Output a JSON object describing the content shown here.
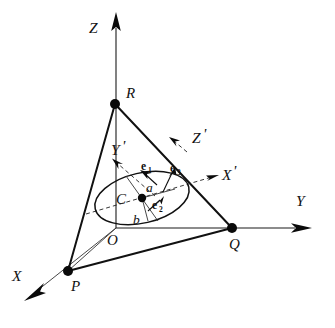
{
  "figure": {
    "background_color": "#ffffff",
    "ink_color": "#111111"
  },
  "global_axes": {
    "z": {
      "label": "Z",
      "arrow": "up"
    },
    "y": {
      "label": "Y",
      "arrow": "right"
    },
    "x": {
      "label": "X",
      "arrow": "down-left"
    }
  },
  "local_axes": {
    "x_prime": {
      "label": "X",
      "prime": "'",
      "arrow": "up-right",
      "style": "dashed"
    },
    "y_prime": {
      "label": "Y",
      "prime": "'",
      "arrow": "up-left",
      "style": "dashed"
    },
    "z_prime": {
      "label": "Z",
      "prime": "'",
      "arrow": "up-right",
      "style": "dashed"
    }
  },
  "points": {
    "origin": {
      "label": "O"
    },
    "p": {
      "label": "P"
    },
    "q": {
      "label": "Q"
    },
    "r": {
      "label": "R"
    },
    "c": {
      "label": "C"
    }
  },
  "ellipse": {
    "semi_major_label": "a",
    "semi_minor_label": "b",
    "center_label": "C"
  },
  "basis_vectors": [
    {
      "symbol": "e",
      "subscript": "1",
      "name": "e1"
    },
    {
      "symbol": "e",
      "subscript": "2",
      "name": "e2"
    },
    {
      "symbol": "e",
      "subscript": "3",
      "name": "e3"
    }
  ]
}
